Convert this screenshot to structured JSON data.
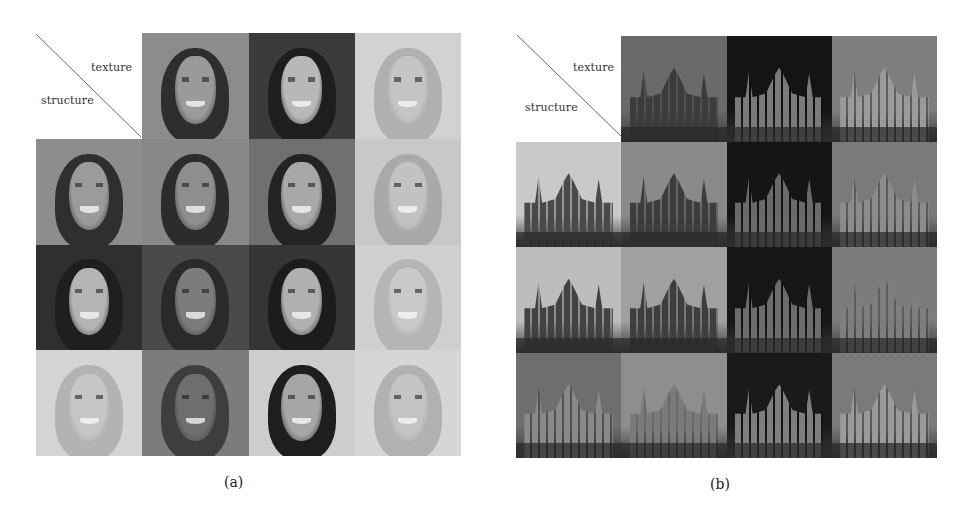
{
  "figure": {
    "panels": [
      {
        "id": "a",
        "caption": "(a)",
        "subject": "faces",
        "axis_labels": {
          "row_axis": "structure",
          "col_axis": "texture"
        },
        "texture_sources": [
          {
            "label": "brunette girl, smiling",
            "tone": "#8a8a8a",
            "hair": "#2e2e2e",
            "skin": "#9a9a9a",
            "bg": "#8c8c8c"
          },
          {
            "label": "dark curly-haired woman, earrings",
            "tone": "#3a3a3a",
            "hair": "#1e1e1e",
            "skin": "#b8b8b8",
            "bg": "#3b3b3b"
          },
          {
            "label": "blonde woman, wavy hair",
            "tone": "#c9c9c9",
            "hair": "#b0b0b0",
            "skin": "#c4c4c4",
            "bg": "#d2d2d2"
          }
        ],
        "rows": [
          {
            "structure_source": {
              "label": "brunette girl",
              "hair": "#2f2f2f",
              "skin": "#9b9b9b",
              "bg": "#8d8d8d"
            },
            "outputs": [
              {
                "hair": "#2c2c2c",
                "skin": "#8e8e8e",
                "bg": "#888888"
              },
              {
                "hair": "#242424",
                "skin": "#a8a8a8",
                "bg": "#707070"
              },
              {
                "hair": "#a9a9a9",
                "skin": "#c2c2c2",
                "bg": "#c8c8c8"
              }
            ]
          },
          {
            "structure_source": {
              "label": "dark curly-haired woman",
              "hair": "#1f1f1f",
              "skin": "#b4b4b4",
              "bg": "#2f2f2f"
            },
            "outputs": [
              {
                "hair": "#2a2a2a",
                "skin": "#7c7c7c",
                "bg": "#4a4a4a"
              },
              {
                "hair": "#1c1c1c",
                "skin": "#b0b0b0",
                "bg": "#353535"
              },
              {
                "hair": "#b5b5b5",
                "skin": "#c9c9c9",
                "bg": "#cfcfcf"
              }
            ]
          },
          {
            "structure_source": {
              "label": "blonde woman",
              "hair": "#b3b3b3",
              "skin": "#c6c6c6",
              "bg": "#d4d4d4"
            },
            "outputs": [
              {
                "hair": "#3e3e3e",
                "skin": "#6e6e6e",
                "bg": "#7c7c7c"
              },
              {
                "hair": "#1e1e1e",
                "skin": "#a6a6a6",
                "bg": "#cdcdcd"
              },
              {
                "hair": "#b1b1b1",
                "skin": "#c3c3c3",
                "bg": "#d6d6d6"
              }
            ]
          }
        ]
      },
      {
        "id": "b",
        "caption": "(b)",
        "subject": "churches",
        "axis_labels": {
          "row_axis": "structure",
          "col_axis": "texture"
        },
        "texture_sources": [
          {
            "label": "gothic church with tree, cloudy sky",
            "sky": "#6a6a6a",
            "building": "#3c3c3c"
          },
          {
            "label": "ornate church at night",
            "sky": "#141414",
            "building": "#7a7a7a"
          },
          {
            "label": "onion-dome cathedral by water",
            "sky": "#7e7e7e",
            "building": "#9a9a9a"
          }
        ],
        "rows": [
          {
            "structure_source": {
              "label": "domed basilica",
              "sky": "#c9c9c9",
              "building": "#4a4a4a"
            },
            "outputs": [
              {
                "sky": "#8a8a8a",
                "building": "#3d3d3d"
              },
              {
                "sky": "#151515",
                "building": "#6a6a6a"
              },
              {
                "sky": "#7a7a7a",
                "building": "#8c8c8c"
              }
            ]
          },
          {
            "structure_source": {
              "label": "gothic cathedral towers",
              "sky": "#bdbdbd",
              "building": "#424242"
            },
            "outputs": [
              {
                "sky": "#a0a0a0",
                "building": "#3e3e3e"
              },
              {
                "sky": "#161616",
                "building": "#6c6c6c"
              },
              {
                "sky": "#7c7c7c",
                "building": "#7e7e7e"
              }
            ]
          },
          {
            "structure_source": {
              "label": "college building with tree",
              "sky": "#6e6e6e",
              "building": "#8a8a8a"
            },
            "outputs": [
              {
                "sky": "#8e8e8e",
                "building": "#7a7a7a"
              },
              {
                "sky": "#1a1a1a",
                "building": "#7e7e7e"
              },
              {
                "sky": "#7a7a7a",
                "building": "#9a9a9a"
              }
            ]
          }
        ]
      }
    ]
  },
  "colors": {
    "page_bg": "#ffffff",
    "text": "#222222",
    "diagonal": "#6a6a6a"
  }
}
